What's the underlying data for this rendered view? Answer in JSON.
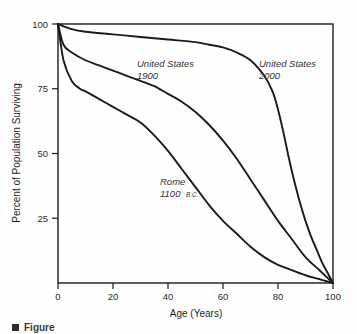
{
  "chart_data": {
    "type": "line",
    "title": "",
    "xlabel": "Age (Years)",
    "ylabel": "Percent of Population Surviving",
    "xlim": [
      0,
      100
    ],
    "ylim": [
      0,
      100
    ],
    "xticks": [
      0,
      20,
      40,
      60,
      80,
      100
    ],
    "yticks": [
      25,
      50,
      75,
      100
    ],
    "grid": false,
    "legend_position": "inline-annotations",
    "series": [
      {
        "name": "Rome 1100 B.C.",
        "label_line1": "Rome",
        "label_line2": "1100",
        "label_small": "B.C.",
        "x": [
          0,
          2,
          5,
          8,
          10,
          15,
          20,
          25,
          30,
          35,
          40,
          45,
          50,
          55,
          60,
          65,
          70,
          75,
          80,
          85,
          90,
          95,
          100
        ],
        "y": [
          100,
          86,
          78,
          75,
          74,
          71,
          68,
          65,
          62,
          57,
          51,
          44,
          37,
          30,
          24,
          19,
          14,
          10,
          7,
          5,
          3,
          1.5,
          0
        ]
      },
      {
        "name": "United States 1900",
        "label_line1": "United States",
        "label_line2": "1900",
        "x": [
          0,
          2,
          5,
          10,
          15,
          20,
          25,
          30,
          35,
          40,
          45,
          50,
          55,
          60,
          65,
          70,
          75,
          80,
          85,
          90,
          95,
          100
        ],
        "y": [
          100,
          92,
          89,
          86,
          84,
          82,
          80,
          78,
          76,
          73,
          70,
          66,
          61,
          55,
          48,
          40,
          32,
          24,
          17,
          10,
          5,
          0
        ]
      },
      {
        "name": "United States 2000",
        "label_line1": "United States",
        "label_line2": "2000",
        "x": [
          0,
          5,
          10,
          20,
          30,
          40,
          50,
          55,
          60,
          65,
          70,
          75,
          78,
          80,
          82,
          84,
          86,
          88,
          90,
          92,
          94,
          96,
          98,
          100
        ],
        "y": [
          100,
          98,
          97,
          96,
          95,
          94,
          93,
          92,
          91,
          89,
          86,
          80,
          74,
          67,
          58,
          48,
          39,
          31,
          24,
          18,
          13,
          8,
          4,
          0
        ]
      }
    ],
    "tick_labels_x": [
      "0",
      "20",
      "40",
      "60",
      "80",
      "100"
    ],
    "tick_labels_y": [
      "25",
      "50",
      "75",
      "100"
    ]
  },
  "caption": {
    "text": "Figure"
  }
}
